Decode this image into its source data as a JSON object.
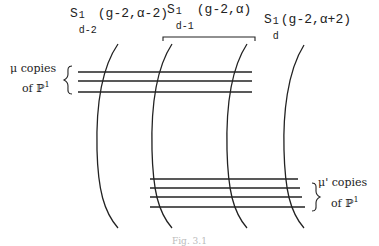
{
  "diagram": {
    "labels": {
      "s1": {
        "base": "S",
        "sup": "1",
        "sub": "d-2",
        "args": "(g-2,α-2)"
      },
      "s2": {
        "base": "S",
        "sup": "1",
        "sub": "d-1",
        "args": "(g-2,α)"
      },
      "s3": {
        "base": "S",
        "sup": "1",
        "sub": "d",
        "args": "(g-2,α+2)"
      }
    },
    "upper_group": {
      "line1": "μ copies",
      "line2_prefix": "of ",
      "line2_P": "ℙ",
      "line2_sup": "1",
      "line_count": 3
    },
    "lower_group": {
      "line1": "μ' copies",
      "line2_prefix": "of ",
      "line2_P": "ℙ",
      "line2_sup": "1",
      "line_count": 4
    },
    "curve_count": 4,
    "caption": "Fig. 3.1",
    "colors": {
      "stroke": "#222222",
      "background": "#ffffff"
    }
  }
}
